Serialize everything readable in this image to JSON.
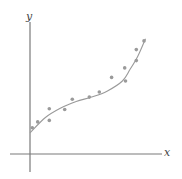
{
  "chart_data": {
    "type": "scatter",
    "title": "",
    "xlabel": "x",
    "ylabel": "y",
    "grid": false,
    "legend": null,
    "annotations": [],
    "points": [
      {
        "x": 0.3,
        "y": 3.6
      },
      {
        "x": 1.0,
        "y": 4.4
      },
      {
        "x": 2.5,
        "y": 4.6
      },
      {
        "x": 2.5,
        "y": 6.2
      },
      {
        "x": 4.5,
        "y": 6.1
      },
      {
        "x": 5.5,
        "y": 7.5
      },
      {
        "x": 7.7,
        "y": 7.8
      },
      {
        "x": 9.0,
        "y": 8.5
      },
      {
        "x": 10.6,
        "y": 10.5
      },
      {
        "x": 12.3,
        "y": 11.8
      },
      {
        "x": 12.4,
        "y": 10.0
      },
      {
        "x": 13.8,
        "y": 12.8
      },
      {
        "x": 13.8,
        "y": 14.3
      },
      {
        "x": 14.8,
        "y": 15.5
      }
    ],
    "fit_curve": {
      "type": "cubic",
      "x": [
        0,
        2,
        4,
        6,
        8,
        10,
        12,
        13,
        14,
        15
      ],
      "y": [
        2.9,
        5.0,
        6.3,
        7.2,
        7.8,
        8.6,
        10.0,
        11.6,
        13.4,
        15.8
      ]
    },
    "xlim": [
      -2.5,
      17
    ],
    "ylim": [
      -2.5,
      19
    ],
    "colors": {
      "points": "#9a9a9a",
      "curve": "#9a9a9a",
      "axes": "#7a7a7a"
    }
  },
  "labels": {
    "x_axis": "x",
    "y_axis": "y"
  }
}
